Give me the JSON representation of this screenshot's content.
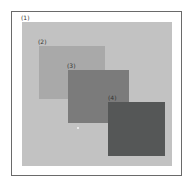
{
  "diagram": {
    "type": "nested-overlapping-regions",
    "regions": [
      {
        "id": "1",
        "label": "(1)",
        "color": "#c2c2c2"
      },
      {
        "id": "2",
        "label": "(2)",
        "color": "#a9a9a9"
      },
      {
        "id": "3",
        "label": "(3)",
        "color": "#7b7b7b"
      },
      {
        "id": "4",
        "label": "(4)",
        "color": "#555757"
      }
    ]
  }
}
